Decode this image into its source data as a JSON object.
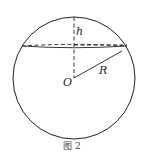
{
  "figure": {
    "caption": "图 2",
    "labels": {
      "height": "h",
      "center": "O",
      "radius": "R"
    },
    "colors": {
      "stroke": "#222222",
      "background": "#ffffff"
    }
  }
}
